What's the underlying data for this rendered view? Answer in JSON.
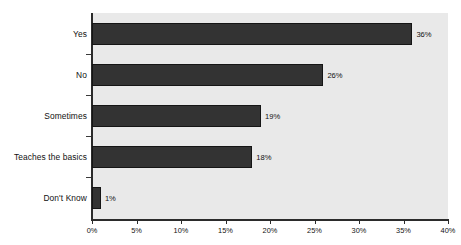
{
  "chart_data": {
    "type": "bar",
    "orientation": "horizontal",
    "title": "",
    "xlabel": "",
    "ylabel": "",
    "categories": [
      "Yes",
      "No",
      "Sometimes",
      "Teaches the basics",
      "Don't Know"
    ],
    "values": [
      36,
      26,
      19,
      18,
      1
    ],
    "data_labels": [
      "36%",
      "26%",
      "19%",
      "18%",
      "1%"
    ],
    "xlim": [
      0,
      40
    ],
    "xticks": [
      0,
      5,
      10,
      15,
      20,
      25,
      30,
      35,
      40
    ],
    "xtick_labels": [
      "0%",
      "5%",
      "10%",
      "15%",
      "20%",
      "25%",
      "30%",
      "35%",
      "40%"
    ],
    "grid": false,
    "legend": false,
    "colors": {
      "bar": "#333333",
      "bar_outline": "#151515",
      "plot_background": "#e9e9e9",
      "page_background": "#ffffff",
      "axis": "#2b2b2b",
      "text": "#111111"
    }
  }
}
